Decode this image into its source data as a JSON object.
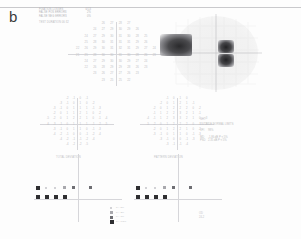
{
  "panel": {
    "label": "b"
  },
  "reliability": {
    "rows": [
      {
        "key": "FIXATION LOSSES",
        "value": "0/13"
      },
      {
        "key": "FALSE POS ERRORS",
        "value": "2%"
      },
      {
        "key": "FALSE NEG ERRORS",
        "value": "0%"
      }
    ],
    "extra": "TEST DURATION  06:32"
  },
  "threshold_plot": {
    "name": "threshold-sensitivity-grid",
    "units": "dB",
    "rows": [
      {
        "y": 0,
        "cells": [
          {
            "x": -9,
            "v": "26"
          },
          {
            "x": -3,
            "v": "27"
          },
          {
            "x": 3,
            "v": "28"
          },
          {
            "x": 9,
            "v": "27"
          }
        ]
      },
      {
        "y": 6,
        "cells": [
          {
            "x": -15,
            "v": "24"
          },
          {
            "x": -9,
            "v": "27"
          },
          {
            "x": -3,
            "v": "29"
          },
          {
            "x": 3,
            "v": "30"
          },
          {
            "x": 9,
            "v": "29"
          },
          {
            "x": 15,
            "v": "26"
          }
        ]
      },
      {
        "y": 12,
        "cells": [
          {
            "x": -21,
            "v": "24"
          },
          {
            "x": -15,
            "v": "27"
          },
          {
            "x": -9,
            "v": "29"
          },
          {
            "x": -3,
            "v": "30"
          },
          {
            "x": 3,
            "v": "31"
          },
          {
            "x": 9,
            "v": "30"
          },
          {
            "x": 15,
            "v": "28"
          },
          {
            "x": 21,
            "v": "25"
          }
        ]
      },
      {
        "y": 18,
        "cells": [
          {
            "x": -21,
            "v": "25"
          },
          {
            "x": -15,
            "v": "28"
          },
          {
            "x": -9,
            "v": "30"
          },
          {
            "x": -3,
            "v": "31"
          },
          {
            "x": 3,
            "v": "31"
          },
          {
            "x": 9,
            "v": "31"
          },
          {
            "x": 15,
            "v": "29"
          },
          {
            "x": 21,
            "v": "26"
          }
        ]
      },
      {
        "y": 24,
        "cells": [
          {
            "x": -27,
            "v": "22"
          },
          {
            "x": -21,
            "v": "26"
          },
          {
            "x": -15,
            "v": "29"
          },
          {
            "x": -9,
            "v": "30"
          },
          {
            "x": -3,
            "v": "31"
          },
          {
            "x": 3,
            "v": "32"
          },
          {
            "x": 9,
            "v": "31"
          },
          {
            "x": 15,
            "v": "29"
          },
          {
            "x": 21,
            "v": "27"
          },
          {
            "x": 27,
            "v": "24"
          }
        ]
      },
      {
        "y": 30,
        "cells": [
          {
            "x": -27,
            "v": "21"
          },
          {
            "x": -21,
            "v": "25"
          },
          {
            "x": -15,
            "v": "28"
          },
          {
            "x": -9,
            "v": "30"
          },
          {
            "x": -3,
            "v": "30"
          },
          {
            "x": 3,
            "v": "31"
          },
          {
            "x": 9,
            "v": "30"
          },
          {
            "x": 15,
            "v": "28"
          },
          {
            "x": 21,
            "v": "26"
          },
          {
            "x": 27,
            "v": "23"
          }
        ]
      },
      {
        "y": 36,
        "cells": [
          {
            "x": -21,
            "v": "24"
          },
          {
            "x": -15,
            "v": "27"
          },
          {
            "x": -9,
            "v": "29"
          },
          {
            "x": -3,
            "v": "30"
          },
          {
            "x": 3,
            "v": "30"
          },
          {
            "x": 9,
            "v": "29"
          },
          {
            "x": 15,
            "v": "27"
          },
          {
            "x": 21,
            "v": "24"
          }
        ]
      },
      {
        "y": 42,
        "cells": [
          {
            "x": -21,
            "v": "22"
          },
          {
            "x": -15,
            "v": "26"
          },
          {
            "x": -9,
            "v": "28"
          },
          {
            "x": -3,
            "v": "29"
          },
          {
            "x": 3,
            "v": "29"
          },
          {
            "x": 9,
            "v": "28"
          },
          {
            "x": 15,
            "v": "26"
          },
          {
            "x": 21,
            "v": "23"
          }
        ]
      },
      {
        "y": 48,
        "cells": [
          {
            "x": -15,
            "v": "23"
          },
          {
            "x": -9,
            "v": "26"
          },
          {
            "x": -3,
            "v": "27"
          },
          {
            "x": 3,
            "v": "27"
          },
          {
            "x": 9,
            "v": "26"
          },
          {
            "x": 15,
            "v": "23"
          }
        ]
      },
      {
        "y": 54,
        "cells": [
          {
            "x": -9,
            "v": "23"
          },
          {
            "x": -3,
            "v": "25"
          },
          {
            "x": 3,
            "v": "25"
          },
          {
            "x": 9,
            "v": "22"
          }
        ]
      }
    ]
  },
  "grayscale_plot": {
    "name": "grayscale-map",
    "defects": [
      {
        "label": "superior-nasal-scotoma",
        "darkness": "dense"
      },
      {
        "label": "central-paracentral-scotoma",
        "darkness": "dense"
      }
    ]
  },
  "total_deviation": {
    "label": "TOTAL DEVIATION",
    "rows": [
      {
        "y": 0,
        "cells": [
          {
            "x": -9,
            "v": "-2"
          },
          {
            "x": -3,
            "v": "-1"
          },
          {
            "x": 3,
            "v": "0"
          },
          {
            "x": 9,
            "v": "-1"
          }
        ]
      },
      {
        "y": 6,
        "cells": [
          {
            "x": -15,
            "v": "-3"
          },
          {
            "x": -9,
            "v": "-1"
          },
          {
            "x": -3,
            "v": "0"
          },
          {
            "x": 3,
            "v": "1"
          },
          {
            "x": 9,
            "v": "0"
          },
          {
            "x": 15,
            "v": "-2"
          }
        ]
      },
      {
        "y": 12,
        "cells": [
          {
            "x": -21,
            "v": "-3"
          },
          {
            "x": -15,
            "v": "-1"
          },
          {
            "x": -9,
            "v": "0"
          },
          {
            "x": -3,
            "v": "1"
          },
          {
            "x": 3,
            "v": "1"
          },
          {
            "x": 9,
            "v": "1"
          },
          {
            "x": 15,
            "v": "-1"
          },
          {
            "x": 21,
            "v": "-3"
          }
        ]
      },
      {
        "y": 18,
        "cells": [
          {
            "x": -21,
            "v": "-2"
          },
          {
            "x": -15,
            "v": "0"
          },
          {
            "x": -9,
            "v": "1"
          },
          {
            "x": -3,
            "v": "1"
          },
          {
            "x": 3,
            "v": "2"
          },
          {
            "x": 9,
            "v": "1"
          },
          {
            "x": 15,
            "v": "0"
          },
          {
            "x": 21,
            "v": "-2"
          }
        ]
      },
      {
        "y": 24,
        "cells": [
          {
            "x": -27,
            "v": "-5"
          },
          {
            "x": -21,
            "v": "-2"
          },
          {
            "x": -15,
            "v": "0"
          },
          {
            "x": -9,
            "v": "1"
          },
          {
            "x": -3,
            "v": "2"
          },
          {
            "x": 3,
            "v": "2"
          },
          {
            "x": 9,
            "v": "1"
          },
          {
            "x": 15,
            "v": "0"
          },
          {
            "x": 21,
            "v": "-1"
          },
          {
            "x": 27,
            "v": "-4"
          }
        ]
      },
      {
        "y": 30,
        "cells": [
          {
            "x": -27,
            "v": "-6"
          },
          {
            "x": -21,
            "v": "-3"
          },
          {
            "x": -15,
            "v": "-1"
          },
          {
            "x": -9,
            "v": "0"
          },
          {
            "x": -3,
            "v": "1"
          },
          {
            "x": 3,
            "v": "1"
          },
          {
            "x": 9,
            "v": "1"
          },
          {
            "x": 15,
            "v": "-1"
          },
          {
            "x": 21,
            "v": "-2"
          },
          {
            "x": 27,
            "v": "-5"
          }
        ]
      },
      {
        "y": 36,
        "cells": [
          {
            "x": -21,
            "v": "-3"
          },
          {
            "x": -15,
            "v": "-1"
          },
          {
            "x": -9,
            "v": "0"
          },
          {
            "x": -3,
            "v": "1"
          },
          {
            "x": 3,
            "v": "1"
          },
          {
            "x": 9,
            "v": "0"
          },
          {
            "x": 15,
            "v": "-1"
          },
          {
            "x": 21,
            "v": "-3"
          }
        ]
      },
      {
        "y": 42,
        "cells": [
          {
            "x": -21,
            "v": "-4"
          },
          {
            "x": -15,
            "v": "-2"
          },
          {
            "x": -9,
            "v": "-1"
          },
          {
            "x": -3,
            "v": "0"
          },
          {
            "x": 3,
            "v": "0"
          },
          {
            "x": 9,
            "v": "-1"
          },
          {
            "x": 15,
            "v": "-2"
          },
          {
            "x": 21,
            "v": "-4"
          }
        ]
      },
      {
        "y": 48,
        "cells": [
          {
            "x": -15,
            "v": "-4"
          },
          {
            "x": -9,
            "v": "-2"
          },
          {
            "x": -3,
            "v": "-1"
          },
          {
            "x": 3,
            "v": "-1"
          },
          {
            "x": 9,
            "v": "-2"
          },
          {
            "x": 15,
            "v": "-4"
          }
        ]
      },
      {
        "y": 54,
        "cells": [
          {
            "x": -9,
            "v": "-4"
          },
          {
            "x": -3,
            "v": "-2"
          },
          {
            "x": 3,
            "v": "-2"
          },
          {
            "x": 9,
            "v": "-5"
          }
        ]
      }
    ]
  },
  "pattern_deviation": {
    "label": "PATTERN DEVIATION",
    "rows": [
      {
        "y": 0,
        "cells": [
          {
            "x": -9,
            "v": "-1"
          },
          {
            "x": -3,
            "v": "0"
          },
          {
            "x": 3,
            "v": "1"
          },
          {
            "x": 9,
            "v": "0"
          }
        ]
      },
      {
        "y": 6,
        "cells": [
          {
            "x": -15,
            "v": "-2"
          },
          {
            "x": -9,
            "v": "0"
          },
          {
            "x": -3,
            "v": "1"
          },
          {
            "x": 3,
            "v": "2"
          },
          {
            "x": 9,
            "v": "1"
          },
          {
            "x": 15,
            "v": "-1"
          }
        ]
      },
      {
        "y": 12,
        "cells": [
          {
            "x": -21,
            "v": "-2"
          },
          {
            "x": -15,
            "v": "0"
          },
          {
            "x": -9,
            "v": "1"
          },
          {
            "x": -3,
            "v": "2"
          },
          {
            "x": 3,
            "v": "2"
          },
          {
            "x": 9,
            "v": "2"
          },
          {
            "x": 15,
            "v": "0"
          },
          {
            "x": 21,
            "v": "-2"
          }
        ]
      },
      {
        "y": 18,
        "cells": [
          {
            "x": -21,
            "v": "-1"
          },
          {
            "x": -15,
            "v": "1"
          },
          {
            "x": -9,
            "v": "2"
          },
          {
            "x": -3,
            "v": "2"
          },
          {
            "x": 3,
            "v": "3"
          },
          {
            "x": 9,
            "v": "2"
          },
          {
            "x": 15,
            "v": "1"
          },
          {
            "x": 21,
            "v": "-1"
          }
        ]
      },
      {
        "y": 24,
        "cells": [
          {
            "x": -27,
            "v": "-4"
          },
          {
            "x": -21,
            "v": "-1"
          },
          {
            "x": -15,
            "v": "1"
          },
          {
            "x": -9,
            "v": "2"
          },
          {
            "x": -3,
            "v": "3"
          },
          {
            "x": 3,
            "v": "3"
          },
          {
            "x": 9,
            "v": "2"
          },
          {
            "x": 15,
            "v": "1"
          },
          {
            "x": 21,
            "v": "0"
          },
          {
            "x": 27,
            "v": "-3"
          }
        ]
      },
      {
        "y": 30,
        "cells": [
          {
            "x": -27,
            "v": "-5"
          },
          {
            "x": -21,
            "v": "-2"
          },
          {
            "x": -15,
            "v": "0"
          },
          {
            "x": -9,
            "v": "1"
          },
          {
            "x": -3,
            "v": "2"
          },
          {
            "x": 3,
            "v": "2"
          },
          {
            "x": 9,
            "v": "2"
          },
          {
            "x": 15,
            "v": "0"
          },
          {
            "x": 21,
            "v": "-1"
          },
          {
            "x": 27,
            "v": "-4"
          }
        ]
      },
      {
        "y": 36,
        "cells": [
          {
            "x": -21,
            "v": "-2"
          },
          {
            "x": -15,
            "v": "0"
          },
          {
            "x": -9,
            "v": "1"
          },
          {
            "x": -3,
            "v": "2"
          },
          {
            "x": 3,
            "v": "2"
          },
          {
            "x": 9,
            "v": "1"
          },
          {
            "x": 15,
            "v": "0"
          },
          {
            "x": 21,
            "v": "-2"
          }
        ]
      },
      {
        "y": 42,
        "cells": [
          {
            "x": -21,
            "v": "-3"
          },
          {
            "x": -15,
            "v": "-1"
          },
          {
            "x": -9,
            "v": "0"
          },
          {
            "x": -3,
            "v": "1"
          },
          {
            "x": 3,
            "v": "1"
          },
          {
            "x": 9,
            "v": "0"
          },
          {
            "x": 15,
            "v": "-1"
          },
          {
            "x": 21,
            "v": "-3"
          }
        ]
      },
      {
        "y": 48,
        "cells": [
          {
            "x": -15,
            "v": "-3"
          },
          {
            "x": -9,
            "v": "-1"
          },
          {
            "x": -3,
            "v": "0"
          },
          {
            "x": 3,
            "v": "0"
          },
          {
            "x": 9,
            "v": "-1"
          },
          {
            "x": 15,
            "v": "-3"
          }
        ]
      },
      {
        "y": 54,
        "cells": [
          {
            "x": -9,
            "v": "-3"
          },
          {
            "x": -3,
            "v": "-1"
          },
          {
            "x": 3,
            "v": "-1"
          },
          {
            "x": 9,
            "v": "-4"
          }
        ]
      }
    ]
  },
  "total_prob_plot": {
    "name": "total-deviation-probability-plot",
    "symbols": [
      {
        "x": 2,
        "y": 10,
        "level": "p05"
      },
      {
        "x": 11,
        "y": 11,
        "level": "p5"
      },
      {
        "x": 20,
        "y": 11,
        "level": "p5"
      },
      {
        "x": 29,
        "y": 10,
        "level": "p2"
      },
      {
        "x": 38,
        "y": 10,
        "level": "p1"
      },
      {
        "x": 55,
        "y": 10,
        "level": "p1"
      },
      {
        "x": 2,
        "y": 19,
        "level": "p05"
      },
      {
        "x": 11,
        "y": 19,
        "level": "p05"
      },
      {
        "x": 20,
        "y": 19,
        "level": "p05"
      },
      {
        "x": 29,
        "y": 19,
        "level": "p05"
      }
    ]
  },
  "pattern_prob_plot": {
    "name": "pattern-deviation-probability-plot",
    "symbols": [
      {
        "x": 2,
        "y": 10,
        "level": "p05"
      },
      {
        "x": 11,
        "y": 11,
        "level": "p5"
      },
      {
        "x": 20,
        "y": 11,
        "level": "p5"
      },
      {
        "x": 29,
        "y": 10,
        "level": "p2"
      },
      {
        "x": 38,
        "y": 10,
        "level": "p1"
      },
      {
        "x": 55,
        "y": 10,
        "level": "p1"
      },
      {
        "x": 2,
        "y": 19,
        "level": "p05"
      },
      {
        "x": 11,
        "y": 19,
        "level": "p05"
      },
      {
        "x": 20,
        "y": 19,
        "level": "p05"
      },
      {
        "x": 29,
        "y": 19,
        "level": "p05"
      }
    ]
  },
  "indices": {
    "ght_label": "GHT",
    "ght_value": "OUTSIDE NORMAL LIMITS",
    "vfi_label": "VFI",
    "vfi_value": "98%",
    "md_key": "MD",
    "md_value": "-1.86 dB  P < 5%",
    "psd_key": "PSD",
    "psd_value": "2.35 dB  P < 5%"
  },
  "legend": {
    "rows": [
      {
        "symbol": "p5",
        "text": "P < 5%"
      },
      {
        "symbol": "p2",
        "text": "P < 2%"
      },
      {
        "symbol": "p1",
        "text": "P < 1%"
      },
      {
        "symbol": "p05",
        "text": "P < 0.5%"
      }
    ]
  },
  "footer_note": {
    "line1": "OD",
    "line2": "24-2"
  },
  "colors": {
    "ink": "#2e2e31",
    "faint": "#c0c0c4",
    "axis": "#d6d6da",
    "paper": "#fdfdfd"
  }
}
